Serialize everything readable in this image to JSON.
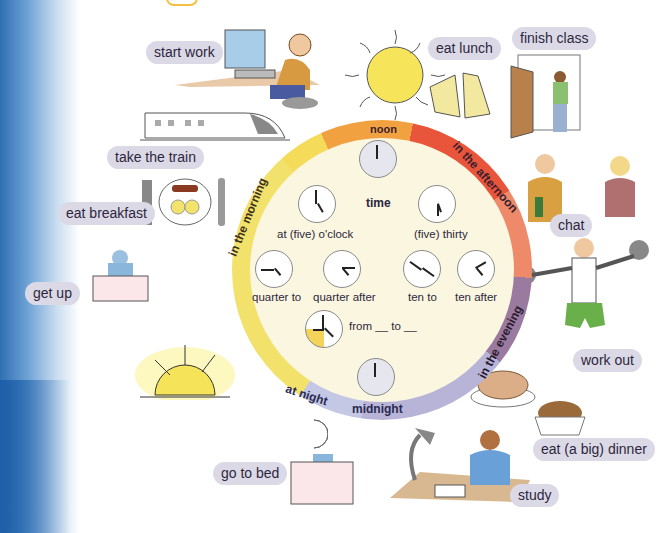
{
  "diagram": {
    "center_title": "time",
    "ring_segments": [
      {
        "label": "noon",
        "color": "#f2a141"
      },
      {
        "label": "in the afternoon",
        "color": "#e8553a"
      },
      {
        "label": "in the evening",
        "color": "#9a7a9e"
      },
      {
        "label": "midnight",
        "color": "#b8b4d8"
      },
      {
        "label": "at night",
        "color": "#c4c8e4"
      },
      {
        "label": "in the morning",
        "color": "#f2e16a"
      }
    ],
    "clocks": [
      {
        "label": "noon",
        "time": "12:00"
      },
      {
        "label": "at (five) o'clock",
        "time": "5:00"
      },
      {
        "label": "(five) thirty",
        "time": "5:30"
      },
      {
        "label": "quarter to",
        "time": "x:45"
      },
      {
        "label": "quarter after",
        "time": "x:15"
      },
      {
        "label": "ten to",
        "time": "x:50"
      },
      {
        "label": "ten after",
        "time": "x:10"
      },
      {
        "label": "from __ to __",
        "time": "range"
      },
      {
        "label": "midnight",
        "time": "12:00"
      }
    ]
  },
  "activities": [
    {
      "label": "start work"
    },
    {
      "label": "take the train"
    },
    {
      "label": "eat breakfast"
    },
    {
      "label": "get up"
    },
    {
      "label": "go to bed"
    },
    {
      "label": "eat lunch"
    },
    {
      "label": "finish class"
    },
    {
      "label": "chat"
    },
    {
      "label": "work out"
    },
    {
      "label": "eat (a big) dinner"
    },
    {
      "label": "study"
    }
  ]
}
